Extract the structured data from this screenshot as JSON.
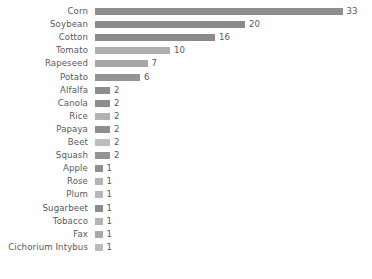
{
  "chart_data": {
    "type": "bar",
    "orientation": "horizontal",
    "title": "",
    "subtitle": "",
    "xlabel": "",
    "ylabel": "",
    "grid": false,
    "legend": null,
    "xlim": [
      0,
      33
    ],
    "axis_visible": false,
    "tick_labels": [],
    "value_labels_shown": true,
    "categories": [
      "Corn",
      "Soybean",
      "Cotton",
      "Tomato",
      "Rapeseed",
      "Potato",
      "Alfalfa",
      "Canola",
      "Rice",
      "Papaya",
      "Beet",
      "Squash",
      "Apple",
      "Rose",
      "Plum",
      "Sugarbeet",
      "Tobacco",
      "Fax",
      "Cichorium Intybus"
    ],
    "values": [
      33,
      20,
      16,
      10,
      7,
      6,
      2,
      2,
      2,
      2,
      2,
      2,
      1,
      1,
      1,
      1,
      1,
      1,
      1
    ],
    "bar_colors": [
      "#8e8e8e",
      "#8b8b8b",
      "#8a8a8a",
      "#b0b0b0",
      "#a6a6a6",
      "#949494",
      "#8d8d8d",
      "#8d8d8d",
      "#b2b2b2",
      "#8e8e8e",
      "#bdbdbd",
      "#939393",
      "#8f8f8f",
      "#b4b4b4",
      "#b6b6b6",
      "#8b8b8b",
      "#b3b3b3",
      "#a8a8a8",
      "#bababa"
    ],
    "label_color": "#5a5a5a",
    "value_color": "#5a5a5a",
    "background_color": "#fefefe"
  }
}
